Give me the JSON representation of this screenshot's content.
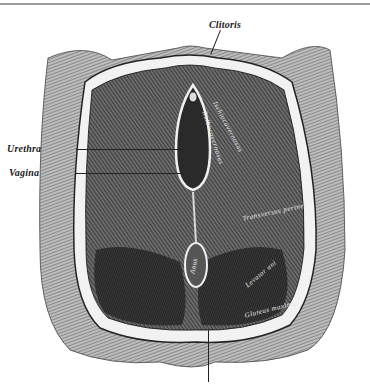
{
  "figure": {
    "type": "anatomical engraving",
    "labels": {
      "top": "Clitoris",
      "left": [
        "Urethra",
        "Vagina"
      ]
    },
    "inline_labels": [
      "Ischiocavernosus",
      "Bulbocavernosus",
      "Transversus perinei",
      "Anus",
      "Levator ani",
      "Gluteus maximus"
    ]
  }
}
